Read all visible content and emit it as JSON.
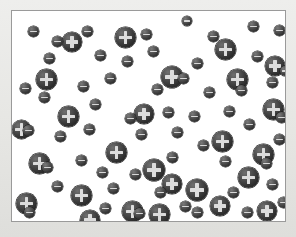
{
  "figure": {
    "name": "particle-distribution-diagram",
    "type": "diagram",
    "description": "Randomly distributed charged particles: large positive ions and small negative particles",
    "caption": "",
    "panel": {
      "background_color": "#ffffff",
      "border_color": "#9a9a9a",
      "page_background_color": "#e9e9e7",
      "x": 11,
      "y": 10,
      "width": 275,
      "height": 212
    },
    "legend": {
      "positive_label": "+",
      "negative_label": "−",
      "positive_name": "positive-ion",
      "negative_name": "negative-particle",
      "positive_color": "#2e2e2e",
      "negative_color": "#333333",
      "glyph_color": "#dcdcdc"
    },
    "counts": {
      "positive": 26,
      "negative": 57,
      "total": 83
    }
  },
  "chart_data": {
    "type": "scatter",
    "title": "",
    "xlabel": "",
    "ylabel": "",
    "xlim": [
      0,
      275
    ],
    "ylim": [
      0,
      212
    ],
    "grid": false,
    "legend_position": "none",
    "series": [
      {
        "name": "positive-ion",
        "symbol": "+",
        "marker_color": "#2e2e2e",
        "glyph_color": "#dcdcdc",
        "points": [
          {
            "x": 103,
            "y": 16,
            "d": 21
          },
          {
            "x": 24,
            "y": 58,
            "d": 21
          },
          {
            "x": 149,
            "y": 55,
            "d": 22
          },
          {
            "x": 215,
            "y": 58,
            "d": 21
          },
          {
            "x": 50,
            "y": 21,
            "d": 20
          },
          {
            "x": 46,
            "y": 95,
            "d": 21
          },
          {
            "x": 122,
            "y": 93,
            "d": 20
          },
          {
            "x": 203,
            "y": 28,
            "d": 21
          },
          {
            "x": 251,
            "y": 88,
            "d": 21
          },
          {
            "x": 0,
            "y": 109,
            "d": 19
          },
          {
            "x": 17,
            "y": 142,
            "d": 21
          },
          {
            "x": 94,
            "y": 131,
            "d": 21
          },
          {
            "x": 200,
            "y": 120,
            "d": 21
          },
          {
            "x": 131,
            "y": 148,
            "d": 22
          },
          {
            "x": 241,
            "y": 133,
            "d": 21
          },
          {
            "x": 4,
            "y": 182,
            "d": 21
          },
          {
            "x": 59,
            "y": 174,
            "d": 21
          },
          {
            "x": 110,
            "y": 190,
            "d": 21
          },
          {
            "x": 174,
            "y": 168,
            "d": 22
          },
          {
            "x": 198,
            "y": 185,
            "d": 20
          },
          {
            "x": 68,
            "y": 199,
            "d": 20
          },
          {
            "x": 150,
            "y": 163,
            "d": 20
          },
          {
            "x": 226,
            "y": 156,
            "d": 21
          },
          {
            "x": 137,
            "y": 193,
            "d": 21
          },
          {
            "x": 245,
            "y": 190,
            "d": 20
          },
          {
            "x": 253,
            "y": 45,
            "d": 20
          }
        ]
      },
      {
        "name": "negative-particle",
        "symbol": "−",
        "marker_color": "#333333",
        "glyph_color": "#d8d8d8",
        "points": [
          {
            "x": 16,
            "y": 15,
            "d": 11
          },
          {
            "x": 40,
            "y": 25,
            "d": 11
          },
          {
            "x": 70,
            "y": 15,
            "d": 11
          },
          {
            "x": 129,
            "y": 18,
            "d": 11
          },
          {
            "x": 170,
            "y": 5,
            "d": 10
          },
          {
            "x": 196,
            "y": 20,
            "d": 11
          },
          {
            "x": 236,
            "y": 10,
            "d": 11
          },
          {
            "x": 262,
            "y": 14,
            "d": 11
          },
          {
            "x": 32,
            "y": 42,
            "d": 11
          },
          {
            "x": 83,
            "y": 39,
            "d": 11
          },
          {
            "x": 110,
            "y": 45,
            "d": 11
          },
          {
            "x": 136,
            "y": 35,
            "d": 11
          },
          {
            "x": 180,
            "y": 47,
            "d": 11
          },
          {
            "x": 240,
            "y": 40,
            "d": 11
          },
          {
            "x": 268,
            "y": 55,
            "d": 10
          },
          {
            "x": 8,
            "y": 72,
            "d": 11
          },
          {
            "x": 66,
            "y": 70,
            "d": 11
          },
          {
            "x": 93,
            "y": 62,
            "d": 11
          },
          {
            "x": 140,
            "y": 73,
            "d": 11
          },
          {
            "x": 166,
            "y": 62,
            "d": 11
          },
          {
            "x": 192,
            "y": 76,
            "d": 11
          },
          {
            "x": 224,
            "y": 74,
            "d": 11
          },
          {
            "x": 255,
            "y": 66,
            "d": 11
          },
          {
            "x": 27,
            "y": 81,
            "d": 11
          },
          {
            "x": 78,
            "y": 88,
            "d": 11
          },
          {
            "x": 113,
            "y": 102,
            "d": 11
          },
          {
            "x": 151,
            "y": 96,
            "d": 11
          },
          {
            "x": 177,
            "y": 100,
            "d": 11
          },
          {
            "x": 212,
            "y": 95,
            "d": 11
          },
          {
            "x": 264,
            "y": 101,
            "d": 11
          },
          {
            "x": 11,
            "y": 114,
            "d": 11
          },
          {
            "x": 43,
            "y": 120,
            "d": 11
          },
          {
            "x": 72,
            "y": 113,
            "d": 11
          },
          {
            "x": 124,
            "y": 118,
            "d": 11
          },
          {
            "x": 160,
            "y": 116,
            "d": 11
          },
          {
            "x": 186,
            "y": 129,
            "d": 11
          },
          {
            "x": 232,
            "y": 108,
            "d": 11
          },
          {
            "x": 262,
            "y": 123,
            "d": 11
          },
          {
            "x": 30,
            "y": 151,
            "d": 11
          },
          {
            "x": 64,
            "y": 144,
            "d": 11
          },
          {
            "x": 118,
            "y": 158,
            "d": 11
          },
          {
            "x": 155,
            "y": 141,
            "d": 11
          },
          {
            "x": 208,
            "y": 145,
            "d": 11
          },
          {
            "x": 249,
            "y": 147,
            "d": 11
          },
          {
            "x": 85,
            "y": 156,
            "d": 11
          },
          {
            "x": 40,
            "y": 170,
            "d": 11
          },
          {
            "x": 96,
            "y": 172,
            "d": 11
          },
          {
            "x": 143,
            "y": 176,
            "d": 11
          },
          {
            "x": 168,
            "y": 190,
            "d": 11
          },
          {
            "x": 216,
            "y": 176,
            "d": 11
          },
          {
            "x": 255,
            "y": 168,
            "d": 11
          },
          {
            "x": 12,
            "y": 196,
            "d": 11
          },
          {
            "x": 88,
            "y": 192,
            "d": 11
          },
          {
            "x": 122,
            "y": 197,
            "d": 11
          },
          {
            "x": 180,
            "y": 196,
            "d": 11
          },
          {
            "x": 230,
            "y": 196,
            "d": 11
          },
          {
            "x": 266,
            "y": 186,
            "d": 11
          }
        ]
      }
    ]
  }
}
